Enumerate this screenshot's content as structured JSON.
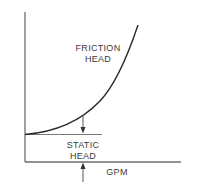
{
  "diagram": {
    "y_axis_label": "TOTAL HEAD IN FEET",
    "x_axis_label": "GPM",
    "friction_label": [
      "FRICTION",
      "HEAD"
    ],
    "static_label": [
      "STATIC",
      "HEAD"
    ],
    "colors": {
      "axis": "#6e6e6e",
      "curve": "#2a2a2a",
      "text": "#3a3a3a",
      "background": "#ffffff"
    },
    "curve_points": [
      [
        25,
        134
      ],
      [
        50,
        130
      ],
      [
        75,
        121
      ],
      [
        100,
        100
      ],
      [
        115,
        80
      ],
      [
        125,
        60
      ],
      [
        138,
        25
      ]
    ]
  }
}
